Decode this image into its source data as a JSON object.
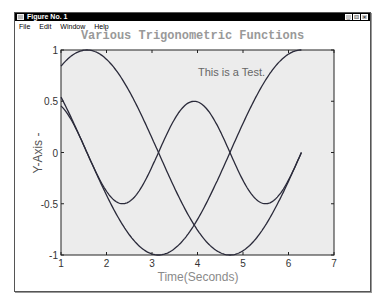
{
  "window": {
    "title": "Figure No. 1",
    "menu": [
      "File",
      "Edit",
      "Window",
      "Help"
    ],
    "buttons": [
      "_",
      "□",
      "×"
    ]
  },
  "chart_data": {
    "type": "line",
    "title": "Various Trigonometric Functions",
    "xlabel": "Time(Seconds)",
    "ylabel": "Y-Axis -",
    "annotation": "This is a Test.",
    "xlim": [
      1,
      7
    ],
    "ylim": [
      -1,
      1
    ],
    "xticks": [
      "1",
      "2",
      "3",
      "4",
      "5",
      "6",
      "7"
    ],
    "yticks": [
      "1",
      "0.5",
      "0",
      "-0.5",
      "-1"
    ],
    "grid": false,
    "x_range": [
      1,
      6.2832
    ],
    "series": [
      {
        "name": "sin(t)",
        "expr": "sin",
        "x_start": 1,
        "x_end": 6.2832,
        "y_start": 0.84,
        "y_end": 0
      },
      {
        "name": "cos(t)",
        "expr": "cos",
        "x_start": 1,
        "x_end": 6.2832,
        "y_start": 0.54,
        "y_end": 1
      },
      {
        "name": "0.5*sin(2t)",
        "expr": "halfsin2",
        "x_start": 1,
        "x_end": 6.2832,
        "y_start": 0.45,
        "y_end": 0
      }
    ],
    "colors": {
      "line": "#2a2a3a",
      "axes_bg": "#ececec",
      "label": "#8a8a8a"
    }
  }
}
